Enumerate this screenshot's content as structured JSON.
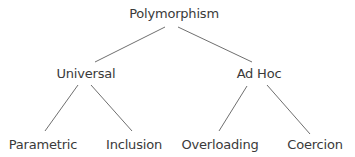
{
  "diagram": {
    "type": "tree",
    "root": {
      "label": "Polymorphism",
      "children": [
        {
          "label": "Universal",
          "children": [
            {
              "label": "Parametric"
            },
            {
              "label": "Inclusion"
            }
          ]
        },
        {
          "label": "Ad Hoc",
          "children": [
            {
              "label": "Overloading"
            },
            {
              "label": "Coercion"
            }
          ]
        }
      ]
    },
    "colors": {
      "text": "#3a3a3a",
      "edge": "#6f6f6f",
      "background": "#ffffff"
    }
  }
}
